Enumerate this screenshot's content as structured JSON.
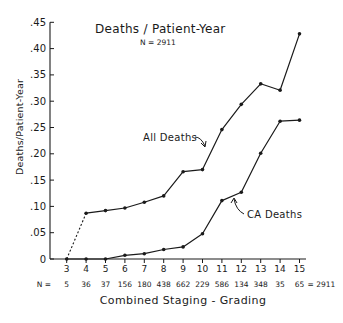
{
  "chart_data": {
    "type": "line",
    "title": "Deaths / Patient-Year",
    "subtitle": "N = 2911",
    "xlabel": "Combined Staging - Grading",
    "ylabel": "Deaths/Patient-Year",
    "x": [
      3,
      4,
      5,
      6,
      7,
      8,
      9,
      10,
      11,
      12,
      13,
      14,
      15
    ],
    "x_tick_labels": [
      "3",
      "4",
      "5",
      "6",
      "7",
      "8",
      "9",
      "10",
      "11",
      "12",
      "13",
      "14",
      "15"
    ],
    "n_row_label": "N =",
    "n_values": [
      "5",
      "36",
      "37",
      "156",
      "180",
      "438",
      "662",
      "229",
      "586",
      "134",
      "348",
      "35",
      "65"
    ],
    "n_total_label": "= 2911",
    "y_ticks": [
      0,
      0.05,
      0.1,
      0.15,
      0.2,
      0.25,
      0.3,
      0.35,
      0.4,
      0.45
    ],
    "y_tick_labels": [
      "0",
      ".05",
      ".10",
      ".15",
      ".20",
      ".25",
      ".30",
      ".35",
      ".40",
      ".45"
    ],
    "ylim": [
      0,
      0.45
    ],
    "grid": false,
    "legend": "inline annotations with arrows",
    "series": [
      {
        "name": "All Deaths",
        "values": [
          0,
          0.087,
          0.092,
          0.097,
          0.108,
          0.12,
          0.166,
          0.17,
          0.246,
          0.294,
          0.333,
          0.321,
          0.428
        ],
        "note": "segment from x=3 to x=4 drawn dotted"
      },
      {
        "name": "CA Deaths",
        "values": [
          0,
          0,
          0,
          0.007,
          0.01,
          0.018,
          0.023,
          0.048,
          0.111,
          0.127,
          0.201,
          0.262,
          0.264
        ]
      }
    ],
    "annotations": [
      {
        "text": "All Deaths",
        "points_to": "All Deaths line near x=10.5"
      },
      {
        "text": "CA Deaths",
        "points_to": "CA Deaths line near x=11.5"
      }
    ]
  },
  "colors": {
    "ink": "#1a1a1a",
    "background": "#ffffff"
  }
}
